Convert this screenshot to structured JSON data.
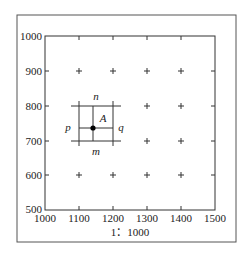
{
  "figure": {
    "scale_label": "1：1000",
    "x_ticks": [
      "1000",
      "1100",
      "1200",
      "1300",
      "1400",
      "1500"
    ],
    "y_ticks": [
      "1000",
      "900",
      "800",
      "700",
      "600",
      "500"
    ],
    "grid_cross_x": [
      1100,
      1200,
      1300,
      1400
    ],
    "grid_cross_y": [
      900,
      800,
      700,
      600
    ],
    "point": {
      "label": "A",
      "x": 1140,
      "y": 735
    },
    "square": {
      "x_min": 1100,
      "x_max": 1200,
      "y_min": 700,
      "y_max": 800
    },
    "side_labels": {
      "top": "n",
      "bottom": "m",
      "left": "p",
      "right": "q"
    }
  }
}
